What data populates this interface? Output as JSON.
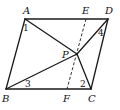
{
  "diagram": {
    "points": {
      "A": {
        "label": "A",
        "x": 25,
        "y": 19
      },
      "D": {
        "label": "D",
        "x": 108,
        "y": 19
      },
      "B": {
        "label": "B",
        "x": 6,
        "y": 89
      },
      "C": {
        "label": "C",
        "x": 91,
        "y": 89
      },
      "E": {
        "label": "E",
        "x": 86,
        "y": 19
      },
      "F": {
        "label": "F",
        "x": 67,
        "y": 89
      },
      "P": {
        "label": "P",
        "x": 77,
        "y": 54
      }
    },
    "angles": {
      "a1": "1",
      "a2": "2",
      "a3": "3",
      "a4": "4"
    },
    "segments": {
      "solid": [
        "AD",
        "AB",
        "BC",
        "CD",
        "AP",
        "BP",
        "PD",
        "PC"
      ],
      "dashed": [
        "EF"
      ]
    }
  }
}
